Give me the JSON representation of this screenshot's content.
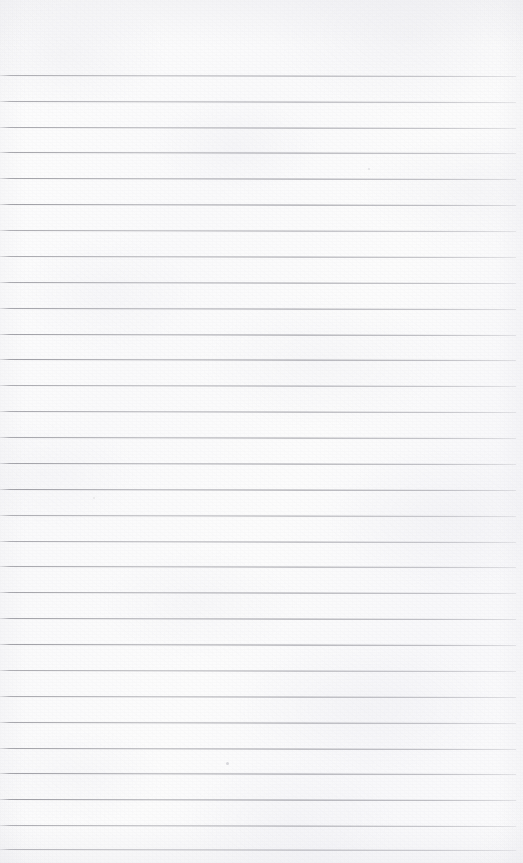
{
  "document": {
    "kind": "lined-notebook-paper-scan",
    "title": "Blank ruled notebook page",
    "width_px": 523,
    "height_px": 863,
    "content_text": "",
    "has_handwriting": false,
    "has_printed_text": false
  },
  "paper": {
    "background_color": "#fbfbfc",
    "tint_color": "#f6f6f8",
    "texture": "mottled fibre grain with soft corner vignette",
    "margin_top_px": 75,
    "margin_left_px": 0,
    "margin_right_px": 7
  },
  "ruling": {
    "style": "wide-ruled horizontal lines",
    "line_color": "#8d8d94",
    "line_thickness_px": 1,
    "line_spacing_px": 25.8,
    "line_start_x_px": 0,
    "line_end_x_px": 516,
    "first_line_y_px": 75,
    "last_line_y_px": 849,
    "slant_deg": 0.12,
    "line_count": 31,
    "line_positions_y_px": [
      75,
      101,
      127,
      152,
      178,
      204,
      230,
      256,
      282,
      308,
      334,
      359,
      385,
      411,
      437,
      463,
      489,
      515,
      541,
      566,
      592,
      618,
      644,
      670,
      696,
      722,
      748,
      773,
      799,
      825,
      849
    ]
  },
  "marks": {
    "specks": [
      {
        "x_px": 226,
        "y_px": 762
      },
      {
        "x_px": 368,
        "y_px": 168
      },
      {
        "x_px": 93,
        "y_px": 497
      }
    ]
  }
}
